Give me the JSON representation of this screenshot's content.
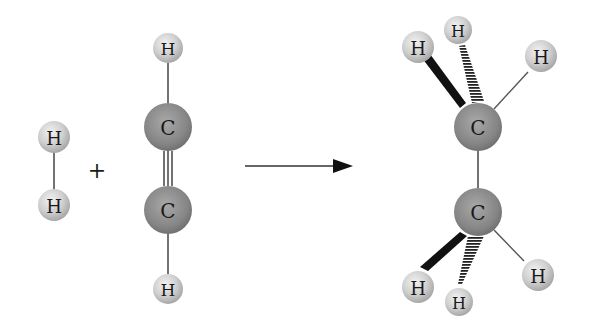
{
  "diagram": {
    "reactants": [
      {
        "name": "hydrogen",
        "atoms": [
          "H",
          "H"
        ]
      },
      {
        "name": "acetylene",
        "atoms": [
          "H",
          "C",
          "C",
          "H"
        ],
        "bond": "triple"
      }
    ],
    "plus_sign": "+",
    "arrow": "reaction-arrow",
    "product": {
      "name": "ethane",
      "atoms": [
        "H",
        "H",
        "H",
        "C",
        "C",
        "H",
        "H",
        "H"
      ]
    },
    "colors": {
      "hydrogen": "#c8c8c8",
      "carbon": "#8a8a8a",
      "bond": "#444444"
    },
    "labels": {
      "h2_top": "H",
      "h2_bottom": "H",
      "ac_h_top": "H",
      "ac_c_top": "C",
      "ac_c_bottom": "C",
      "ac_h_bottom": "H",
      "et_h_wedge_top": "H",
      "et_h_dash_top": "H",
      "et_h_right_top": "H",
      "et_c_top": "C",
      "et_c_bottom": "C",
      "et_h_wedge_bottom": "H",
      "et_h_dash_bottom": "H",
      "et_h_right_bottom": "H"
    }
  }
}
